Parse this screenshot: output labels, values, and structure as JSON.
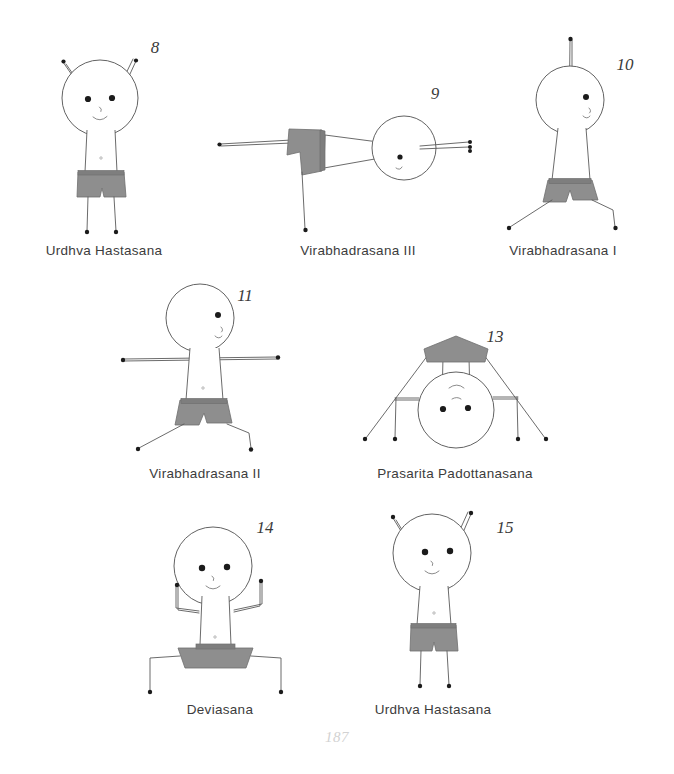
{
  "page": {
    "page_number": "187",
    "background_color": "#ffffff",
    "ink_color": "#4a4a4a",
    "shorts_color": "#8e8e8e",
    "shorts_stroke": "#6f6f6f",
    "label_color": "#3c3c3c",
    "page_number_color": "#d2d2d2"
  },
  "figures": [
    {
      "number": "8",
      "label": "Urdhva Hastasana",
      "number_x": 155,
      "number_y": 38,
      "label_x": 104,
      "label_y": 243,
      "pose": "standing, arms raised overhead"
    },
    {
      "number": "9",
      "label": "Virabhadrasana III",
      "number_x": 435,
      "number_y": 84,
      "label_x": 358,
      "label_y": 243,
      "pose": "horizontal balance on one leg"
    },
    {
      "number": "10",
      "label": "Virabhadrasana I",
      "number_x": 625,
      "number_y": 55,
      "label_x": 563,
      "label_y": 243,
      "pose": "warrior one, arms up, legs lunged"
    },
    {
      "number": "11",
      "label": "Virabhadrasana II",
      "number_x": 245,
      "number_y": 286,
      "label_x": 205,
      "label_y": 466,
      "pose": "warrior two, arms horizontal"
    },
    {
      "number": "13",
      "label": "Prasarita Padottanasana",
      "number_x": 495,
      "number_y": 327,
      "label_x": 455,
      "label_y": 466,
      "pose": "wide-legged forward fold, inverted"
    },
    {
      "number": "14",
      "label": "Deviasana",
      "number_x": 265,
      "number_y": 518,
      "label_x": 220,
      "label_y": 702,
      "pose": "goddess squat, arms bent up"
    },
    {
      "number": "15",
      "label": "Urdhva Hastasana",
      "number_x": 505,
      "number_y": 518,
      "label_x": 433,
      "label_y": 702,
      "pose": "standing, arms raised overhead"
    }
  ]
}
